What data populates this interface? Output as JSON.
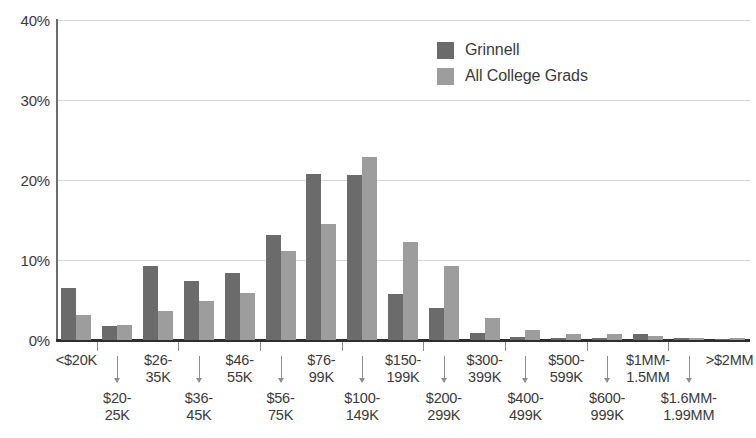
{
  "chart_data": {
    "type": "bar",
    "title": "",
    "subtitle": "",
    "xlabel": "",
    "ylabel": "",
    "ylim": [
      0,
      40
    ],
    "ytick_values": [
      0,
      10,
      20,
      30,
      40
    ],
    "ytick_labels": [
      "0%",
      "10%",
      "20%",
      "30%",
      "40%"
    ],
    "grid": true,
    "legend_position": "top-right",
    "categories": [
      "<$20K",
      "$20-25K",
      "$26-35K",
      "$36-45K",
      "$46-55K",
      "$56-75K",
      "$76-99K",
      "$100-149K",
      "$150-199K",
      "$200-299K",
      "$300-399K",
      "$400-499K",
      "$500-599K",
      "$600-999K",
      "$1MM-1.5MM",
      "$1.6MM-1.99MM",
      ">$2MM"
    ],
    "category_labels_display": [
      "<$20K",
      "$20-\n25K",
      "$26-\n35K",
      "$36-\n45K",
      "$46-\n55K",
      "$56-\n75K",
      "$76-\n99K",
      "$100-\n149K",
      "$150-\n199K",
      "$200-\n299K",
      "$300-\n399K",
      "$400-\n499K",
      "$500-\n599K",
      "$600-\n999K",
      "$1MM-\n1.5MM",
      "$1.6MM-\n1.99MM",
      ">$2MM"
    ],
    "series": [
      {
        "name": "Grinnell",
        "color": "#6b6b6b",
        "values": [
          6.5,
          1.8,
          9.2,
          7.4,
          8.4,
          13.1,
          20.8,
          20.6,
          5.8,
          4.0,
          0.9,
          0.4,
          0.2,
          0.2,
          0.7,
          0.2,
          0.1
        ]
      },
      {
        "name": "All College Grads",
        "color": "#9d9d9d",
        "values": [
          3.1,
          1.9,
          3.6,
          4.9,
          5.9,
          11.1,
          14.5,
          22.9,
          12.2,
          9.3,
          2.7,
          1.3,
          0.8,
          0.8,
          0.5,
          0.3,
          0.2
        ]
      }
    ]
  },
  "legend": {
    "items": [
      {
        "label": "Grinnell",
        "color": "#6b6b6b"
      },
      {
        "label": "All College Grads",
        "color": "#9d9d9d"
      }
    ]
  },
  "axes": {
    "y": {
      "ticks": [
        {
          "label": "40%",
          "value": 40
        },
        {
          "label": "30%",
          "value": 30
        },
        {
          "label": "20%",
          "value": 20
        },
        {
          "label": "10%",
          "value": 10
        },
        {
          "label": "0%",
          "value": 0
        }
      ]
    }
  },
  "colors": {
    "series_dark": "#6b6b6b",
    "series_light": "#9d9d9d",
    "gridline": "#d6d6d6",
    "axis": "#2e2e2e",
    "text": "#3a3a3a",
    "background": "#ffffff"
  }
}
